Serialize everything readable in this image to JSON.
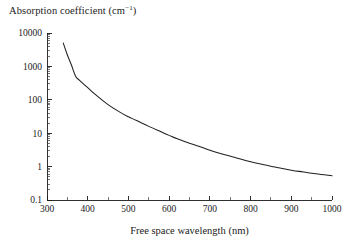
{
  "chart_data": {
    "type": "line",
    "title": "Absorption coefficient (cm−1)",
    "title_main": "Absorption coefficient (cm",
    "title_sup": "−1",
    "title_tail": ")",
    "xlabel": "Free space wavelength (nm)",
    "ylabel": "Absorption coefficient (cm−1)",
    "xscale": "linear",
    "yscale": "log",
    "xlim": [
      300,
      1000
    ],
    "ylim": [
      0.1,
      10000
    ],
    "grid": false,
    "legend": false,
    "x_ticks_major": [
      300,
      400,
      500,
      600,
      700,
      800,
      900,
      1000
    ],
    "x_tick_labels": [
      "300",
      "400",
      "500",
      "600",
      "700",
      "800",
      "900",
      "1000"
    ],
    "x_ticks_minor": [
      350,
      450,
      550,
      650,
      750,
      850,
      950
    ],
    "y_ticks_major": [
      0.1,
      1,
      10,
      100,
      1000,
      10000
    ],
    "y_tick_labels": [
      "0.1",
      "1",
      "10",
      "100",
      "1000",
      "10000"
    ],
    "series": [
      {
        "name": "absorption coefficient",
        "color": "#202020",
        "x": [
          340,
          350,
          360,
          370,
          380,
          400,
          420,
          450,
          480,
          500,
          520,
          550,
          580,
          600,
          620,
          650,
          680,
          700,
          730,
          760,
          800,
          830,
          860,
          900,
          930,
          960,
          1000
        ],
        "y": [
          5000,
          2200,
          1100,
          520,
          380,
          230,
          140,
          72,
          42,
          31,
          24,
          16,
          11,
          8.6,
          6.8,
          5.0,
          3.8,
          3.1,
          2.4,
          1.9,
          1.4,
          1.15,
          0.97,
          0.78,
          0.69,
          0.61,
          0.53
        ]
      }
    ],
    "annotations": []
  },
  "plot_geometry": {
    "x_axis_left_px": 47,
    "x_axis_right_px": 332,
    "y_axis_top_px": 33,
    "y_axis_bottom_px": 200
  }
}
